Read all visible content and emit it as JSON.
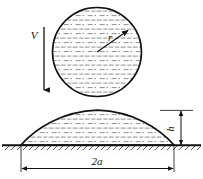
{
  "figure": {
    "background_color": "#ffffff",
    "line_color": "#111111",
    "hatch_color": "#8a8a8a",
    "ground_color": "#333333",
    "labels": {
      "velocity": "V",
      "radius": "r",
      "height": "h",
      "width": "2a"
    },
    "upper_shape": {
      "name": "drop-circle",
      "type": "circle",
      "center_x": 97,
      "center_y": 52,
      "radius": 45,
      "fill_pattern": "horizontal-dashed-liquid-hatch"
    },
    "velocity_arrow": {
      "name": "velocity-arrow",
      "x": 44,
      "y_start": 27,
      "y_end": 93,
      "direction": "down",
      "label": "V",
      "label_x": 33,
      "label_y": 38
    },
    "radius_arrow": {
      "name": "radius-arrow",
      "from_x": 97,
      "from_y": 52,
      "to_x": 129,
      "to_y": 30,
      "label": "r",
      "label_x": 110,
      "label_y": 39
    },
    "lower_shape": {
      "name": "puddle-dome",
      "type": "dome",
      "left_x": 21,
      "right_x": 174,
      "base_y": 145,
      "apex_y": 110,
      "fill_pattern": "horizontal-dashed-liquid-hatch"
    },
    "ground": {
      "name": "ground-hatched-surface",
      "y": 145,
      "x_start": 2,
      "x_end": 201,
      "hatch_angle_deg": 45
    },
    "height_dimension": {
      "name": "height-dimension",
      "x": 180,
      "y_top": 110,
      "y_bottom": 145,
      "label": "h",
      "label_x": 176,
      "label_y": 128
    },
    "width_dimension": {
      "name": "width-dimension",
      "y": 168,
      "x_left": 21,
      "x_right": 174,
      "label": "2a",
      "label_x": 97,
      "label_y": 163
    }
  }
}
